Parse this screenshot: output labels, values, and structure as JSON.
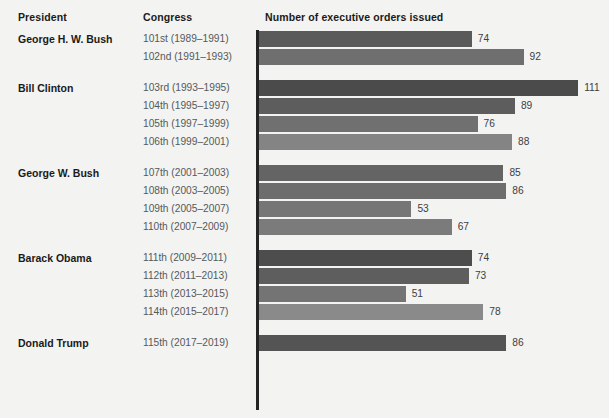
{
  "header": {
    "col_president": "President",
    "col_congress": "Congress",
    "col_orders": "Number of executive orders issued"
  },
  "chart_data": {
    "type": "bar",
    "orientation": "horizontal",
    "title": "Number of executive orders issued",
    "xlabel": "Number of executive orders issued",
    "ylabel": "Congress",
    "grid": false,
    "legend": false,
    "xlim": [
      0,
      120
    ],
    "categories": [
      "101st (1989–1991)",
      "102nd (1991–1993)",
      "103rd (1993–1995)",
      "104th (1995–1997)",
      "105th (1997–1999)",
      "106th (1999–2001)",
      "107th (2001–2003)",
      "108th (2003–2005)",
      "109th (2005–2007)",
      "110th (2007–2009)",
      "111th (2009–2011)",
      "112th (2011–2013)",
      "113th (2013–2015)",
      "114th (2015–2017)",
      "115th (2017–2019)"
    ],
    "values": [
      74,
      92,
      111,
      89,
      76,
      88,
      85,
      86,
      53,
      67,
      74,
      73,
      51,
      78,
      86
    ],
    "groups": [
      {
        "president": "George H. W. Bush",
        "rows": [
          {
            "congress": "101st (1989–1991)",
            "value": 74,
            "color": "#5a5a5a"
          },
          {
            "congress": "102nd (1991–1993)",
            "value": 92,
            "color": "#6f6f6f"
          }
        ]
      },
      {
        "president": "Bill Clinton",
        "rows": [
          {
            "congress": "103rd (1993–1995)",
            "value": 111,
            "color": "#4b4b4b"
          },
          {
            "congress": "104th (1995–1997)",
            "value": 89,
            "color": "#5d5d5d"
          },
          {
            "congress": "105th (1997–1999)",
            "value": 76,
            "color": "#707070"
          },
          {
            "congress": "106th (1999–2001)",
            "value": 88,
            "color": "#848484"
          }
        ]
      },
      {
        "president": "George W. Bush",
        "rows": [
          {
            "congress": "107th (2001–2003)",
            "value": 85,
            "color": "#646464"
          },
          {
            "congress": "108th (2003–2005)",
            "value": 86,
            "color": "#6d6d6d"
          },
          {
            "congress": "109th (2005–2007)",
            "value": 53,
            "color": "#767676"
          },
          {
            "congress": "110th (2007–2009)",
            "value": 67,
            "color": "#7b7b7b"
          }
        ]
      },
      {
        "president": "Barack Obama",
        "rows": [
          {
            "congress": "111th (2009–2011)",
            "value": 74,
            "color": "#4d4d4d"
          },
          {
            "congress": "112th (2011–2013)",
            "value": 73,
            "color": "#5e5e5e"
          },
          {
            "congress": "113th (2013–2015)",
            "value": 51,
            "color": "#747474"
          },
          {
            "congress": "114th (2015–2017)",
            "value": 78,
            "color": "#8a8a8a"
          }
        ]
      },
      {
        "president": "Donald Trump",
        "rows": [
          {
            "congress": "115th (2017–2019)",
            "value": 86,
            "color": "#545454"
          }
        ]
      }
    ]
  },
  "scale": {
    "px_per_unit": 2.875,
    "axis_color": "#242424",
    "background": "#f3f3f1"
  }
}
